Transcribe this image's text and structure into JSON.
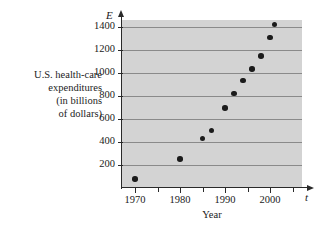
{
  "figure": {
    "y_axis_description_lines": [
      "U.S. health-care",
      "expenditures",
      "(in billions",
      "of dollars)"
    ],
    "y_axis_symbol": "E",
    "x_axis_symbol": "t",
    "x_axis_title": "Year",
    "plot_background_color": "#d3d3d3",
    "gridline_color": "#8a8a8a",
    "axis_color": "#2a2a2a",
    "point_color": "#1b1b1b"
  },
  "chart_data": {
    "type": "scatter",
    "title": "",
    "subtitle": "",
    "xlabel": "Year",
    "ylabel": "U.S. health-care expenditures (in billions of dollars)",
    "x_symbol": "t",
    "y_symbol": "E",
    "xlim": [
      1966,
      2006
    ],
    "ylim": [
      0,
      1500
    ],
    "xticks": [
      1970,
      1980,
      1990,
      2000
    ],
    "xtick_labels": [
      "1970",
      "1980",
      "1990",
      "2000"
    ],
    "x_minor_ticks": [
      1975,
      1985,
      1995,
      2005
    ],
    "yticks": [
      200,
      400,
      600,
      800,
      1000,
      1200,
      1400
    ],
    "ytick_labels": [
      "200",
      "400",
      "600",
      "800",
      "1000",
      "1200",
      "1400"
    ],
    "grid": "horizontal",
    "legend": "none",
    "x": [
      1970,
      1980,
      1985,
      1987,
      1990,
      1992,
      1994,
      1996,
      1998,
      2000,
      2001
    ],
    "values": [
      80,
      250,
      430,
      500,
      695,
      820,
      935,
      1035,
      1150,
      1310,
      1420
    ],
    "points": [
      {
        "x": 1970,
        "y": 80
      },
      {
        "x": 1980,
        "y": 250
      },
      {
        "x": 1985,
        "y": 430
      },
      {
        "x": 1987,
        "y": 500
      },
      {
        "x": 1990,
        "y": 695
      },
      {
        "x": 1992,
        "y": 820
      },
      {
        "x": 1994,
        "y": 935
      },
      {
        "x": 1996,
        "y": 1035
      },
      {
        "x": 1998,
        "y": 1150
      },
      {
        "x": 2000,
        "y": 1310
      },
      {
        "x": 2001,
        "y": 1420
      }
    ]
  }
}
